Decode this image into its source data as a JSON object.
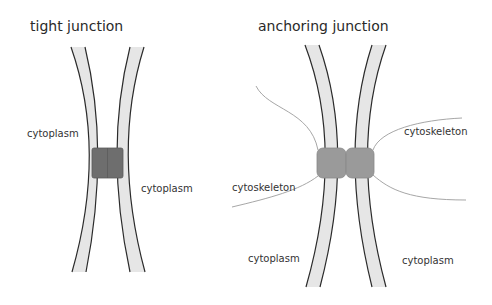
{
  "diagrams": [
    {
      "title": "tight junction",
      "labels": {
        "cytoplasm_left": "cytoplasm",
        "cytoplasm_right": "cytoplasm"
      }
    },
    {
      "title": "anchoring junction",
      "labels": {
        "cytoskeleton_right": "cytoskeleton",
        "cytoskeleton_left": "cytoskeleton",
        "cytoplasm_left": "cytoplasm",
        "cytoplasm_right": "cytoplasm"
      }
    }
  ],
  "colors": {
    "membrane_fill": "#e6e6e6",
    "membrane_edge": "#2b2b2b",
    "tight_junction_block": "#6e6e6e",
    "anchoring_block": "#9a9a9a",
    "cytoskeleton_line": "#9c9c9c",
    "background": "#ffffff"
  }
}
